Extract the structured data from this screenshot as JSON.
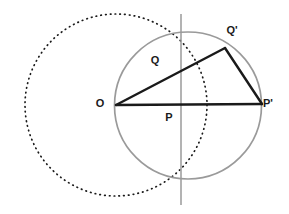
{
  "diagram": {
    "canvas": {
      "width": 289,
      "height": 214,
      "background": "#ffffff"
    },
    "colors": {
      "solid_circle": "#9a9a9a",
      "dotted_circle": "#1a1a1a",
      "vertical_line": "#9a9a9a",
      "triangle": "#1a1a1a",
      "label": "#1a1a1a"
    },
    "labels": {
      "o": "O",
      "q": "Q",
      "q_prime": "Q'",
      "p": "P",
      "p_prime": "P'"
    },
    "label_positions": {
      "o": {
        "x": 100,
        "y": 107
      },
      "q": {
        "x": 155,
        "y": 64
      },
      "q_prime": {
        "x": 232,
        "y": 34
      },
      "p": {
        "x": 169,
        "y": 121
      },
      "p_prime": {
        "x": 268,
        "y": 107
      }
    },
    "shapes": {
      "solid_circle": {
        "cx": 188,
        "cy": 105.5,
        "r": 73.5,
        "stroke_width": 1.6,
        "style": "solid"
      },
      "dotted_circle": {
        "cx": 116,
        "cy": 105,
        "r": 91,
        "stroke_width": 1.6,
        "style": "dotted"
      },
      "vertical_line": {
        "x": 181,
        "y1": 14,
        "y2": 205,
        "stroke_width": 1.4
      }
    },
    "points": {
      "o": {
        "x": 116,
        "y": 105
      },
      "p": {
        "x": 181,
        "y": 105
      },
      "q": {
        "x": 181,
        "y": 33.5
      },
      "q_prime": {
        "x": 225,
        "y": 48
      },
      "p_prime": {
        "x": 262,
        "y": 104
      }
    },
    "triangle_edges": [
      {
        "name": "o-to-q-prime",
        "from": "o",
        "to": "q_prime"
      },
      {
        "name": "q-prime-to-p-prime",
        "from": "q_prime",
        "to": "p_prime"
      },
      {
        "name": "p-prime-to-o",
        "from": "p_prime",
        "to": "o"
      }
    ]
  }
}
